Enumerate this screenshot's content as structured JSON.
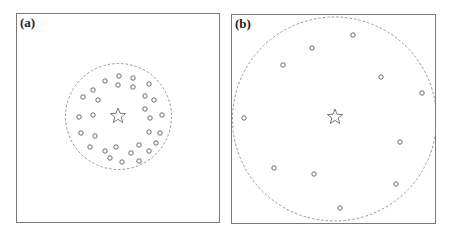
{
  "panels": [
    {
      "id": "a",
      "label": "(a)",
      "frame": {
        "x": 16,
        "y": 13,
        "w": 204,
        "h": 210
      },
      "boundary_circle": {
        "cx": 118.5,
        "cy": 116.5,
        "r": 53
      },
      "center_star": {
        "x": 118,
        "y": 116
      },
      "points": [
        [
          119,
          76
        ],
        [
          133,
          78
        ],
        [
          105,
          81
        ],
        [
          118,
          85
        ],
        [
          133,
          87
        ],
        [
          149,
          84
        ],
        [
          93,
          90
        ],
        [
          83,
          97
        ],
        [
          98,
          100
        ],
        [
          145,
          96
        ],
        [
          154,
          100
        ],
        [
          145,
          109
        ],
        [
          79,
          117
        ],
        [
          93,
          115
        ],
        [
          150,
          118
        ],
        [
          162,
          115
        ],
        [
          81,
          133
        ],
        [
          95,
          136
        ],
        [
          149,
          132
        ],
        [
          160,
          133
        ],
        [
          90,
          147
        ],
        [
          116,
          147
        ],
        [
          105,
          151
        ],
        [
          139,
          145
        ],
        [
          156,
          143
        ],
        [
          149,
          151
        ],
        [
          110,
          158
        ],
        [
          131,
          153
        ],
        [
          122,
          162
        ],
        [
          139,
          161
        ]
      ]
    },
    {
      "id": "b",
      "label": "(b)",
      "frame": {
        "x": 231,
        "y": 14,
        "w": 205,
        "h": 210
      },
      "boundary_circle": {
        "cx": 334.5,
        "cy": 119,
        "r": 102
      },
      "center_star": {
        "x": 335,
        "y": 117
      },
      "points": [
        [
          353,
          35
        ],
        [
          312,
          48
        ],
        [
          283,
          65
        ],
        [
          381,
          77
        ],
        [
          422,
          93
        ],
        [
          244,
          118
        ],
        [
          400,
          142
        ],
        [
          274,
          168
        ],
        [
          314,
          174
        ],
        [
          396,
          184
        ],
        [
          340,
          208
        ]
      ]
    }
  ],
  "style": {
    "frame_color": "#7a7a7a",
    "circle_color": "#8a8a8a",
    "point_color": "#6a6a6a",
    "star_color": "#6a6a6a"
  }
}
